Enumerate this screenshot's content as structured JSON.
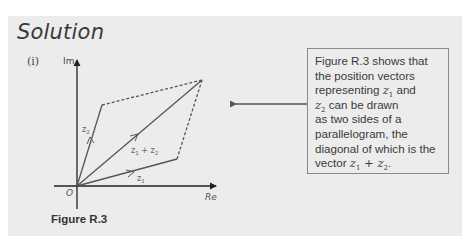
{
  "heading": "Solution",
  "part_label": "(i)",
  "figure": {
    "axis_imaginary_label": "Im",
    "axis_real_label": "Re",
    "origin_label": "O",
    "vectors": [
      {
        "name": "z1",
        "label": "z",
        "subscript": "1"
      },
      {
        "name": "z2",
        "label": "z",
        "subscript": "2"
      },
      {
        "name": "z1_plus_z2",
        "label_a": "z",
        "sub_a": "1",
        "plus": "+",
        "label_b": "z",
        "sub_b": "2"
      }
    ],
    "caption": "Figure R.3"
  },
  "callout": {
    "line1": "Figure R.3 shows that",
    "line2": "the position vectors",
    "line3_text": "representing ",
    "line3_math": "z",
    "line3_sub": "1",
    "line3_tail": " and",
    "line4_math": "z",
    "line4_sub": "2",
    "line4_tail": " can be drawn",
    "line5": "as two sides of a",
    "line6": "parallelogram, the",
    "line7": "diagonal of which is the",
    "line8_text": "vector ",
    "line8_math_a": "z",
    "line8_sub_a": "1",
    "line8_plus": " + ",
    "line8_math_b": "z",
    "line8_sub_b": "2",
    "line8_tail": "."
  },
  "colors": {
    "panel_bg": "#ececec",
    "text": "#3a3a3a",
    "vector_line": "#555555",
    "axis_line": "#222222",
    "box_border": "#8a8a8a"
  }
}
